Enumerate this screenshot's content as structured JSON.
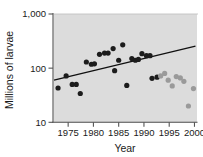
{
  "chart_data": {
    "type": "scatter",
    "title": "",
    "xlabel": "Year",
    "ylabel": "Millions of larvae",
    "xlim": [
      1972,
      2000.5
    ],
    "ylim": [
      10,
      1000
    ],
    "yscale": "log",
    "xticks": [
      1975,
      1980,
      1985,
      1990,
      1995,
      2000
    ],
    "xtick_labels": [
      "1975",
      "1980",
      "1985",
      "1990",
      "1995",
      "2000"
    ],
    "yticks": [
      10,
      100,
      1000
    ],
    "ytick_labels": [
      "10",
      "100",
      "1,000"
    ],
    "grid": "horizontal-top-only",
    "gridlines": [
      1000
    ],
    "legend": "none",
    "plot_background": "#dcdcdc",
    "series": [
      {
        "name": "dark-points",
        "color": "#1c1c1c",
        "marker": "circle",
        "points": [
          {
            "x": 1973.0,
            "y": 43
          },
          {
            "x": 1974.6,
            "y": 72
          },
          {
            "x": 1975.8,
            "y": 50
          },
          {
            "x": 1976.6,
            "y": 50
          },
          {
            "x": 1977.4,
            "y": 34
          },
          {
            "x": 1978.6,
            "y": 130
          },
          {
            "x": 1979.6,
            "y": 118
          },
          {
            "x": 1980.2,
            "y": 120
          },
          {
            "x": 1981.2,
            "y": 180
          },
          {
            "x": 1982.2,
            "y": 190
          },
          {
            "x": 1982.9,
            "y": 190
          },
          {
            "x": 1983.9,
            "y": 230
          },
          {
            "x": 1984.2,
            "y": 90
          },
          {
            "x": 1985.0,
            "y": 140
          },
          {
            "x": 1985.8,
            "y": 270
          },
          {
            "x": 1986.6,
            "y": 48
          },
          {
            "x": 1987.6,
            "y": 150
          },
          {
            "x": 1988.3,
            "y": 140
          },
          {
            "x": 1988.9,
            "y": 145
          },
          {
            "x": 1989.6,
            "y": 185
          },
          {
            "x": 1990.5,
            "y": 170
          },
          {
            "x": 1991.2,
            "y": 170
          },
          {
            "x": 1991.6,
            "y": 65
          },
          {
            "x": 1992.6,
            "y": 68
          }
        ]
      },
      {
        "name": "light-points",
        "color": "#9a9a9a",
        "marker": "circle",
        "points": [
          {
            "x": 1993.3,
            "y": 72
          },
          {
            "x": 1994.1,
            "y": 80
          },
          {
            "x": 1994.8,
            "y": 60
          },
          {
            "x": 1995.6,
            "y": 47
          },
          {
            "x": 1996.4,
            "y": 70
          },
          {
            "x": 1997.2,
            "y": 66
          },
          {
            "x": 1997.9,
            "y": 57
          },
          {
            "x": 1998.8,
            "y": 20
          },
          {
            "x": 1999.8,
            "y": 42
          }
        ]
      }
    ],
    "trendline": {
      "name": "linear-fit",
      "color": "#101010",
      "x_start": 1972.2,
      "y_start": 60,
      "x_end": 2000.2,
      "y_end": 255
    }
  },
  "axes": {
    "x_title": "Year",
    "y_title": "Millions of larvae"
  }
}
